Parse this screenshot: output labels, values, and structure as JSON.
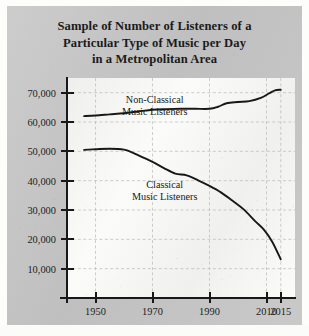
{
  "card": {
    "title_lines": [
      "Sample of Number of Listeners of a",
      "Particular Type of Music per Day",
      "in a Metropolitan Area"
    ]
  },
  "chart_data": {
    "type": "line",
    "title": "Sample of Number of Listeners of a Particular Type of Music per Day in a Metropolitan Area",
    "xlabel": "",
    "ylabel": "",
    "grid": true,
    "legend_position": "inline-annotations",
    "xlim": [
      1940,
      2020
    ],
    "ylim": [
      0,
      75000
    ],
    "xticks": [
      1950,
      1970,
      1990,
      2010,
      2015
    ],
    "yticks": [
      10000,
      20000,
      30000,
      40000,
      50000,
      60000,
      70000
    ],
    "ytick_labels": [
      "10,000",
      "20,000",
      "30,000",
      "40,000",
      "50,000",
      "60,000",
      "70,000"
    ],
    "xtick_labels": [
      "1950",
      "1970",
      "1990",
      "2010",
      "2015"
    ],
    "annotations": [
      {
        "text_lines": [
          "Non-Classical",
          "Music Listeners"
        ],
        "series": "Non-Classical Music Listeners"
      },
      {
        "text_lines": [
          "Classical",
          "Music Listeners"
        ],
        "series": "Classical Music Listeners"
      }
    ],
    "series": [
      {
        "name": "Non-Classical Music Listeners",
        "color": "#16181a",
        "x": [
          1946,
          1950,
          1955,
          1960,
          1965,
          1970,
          1975,
          1980,
          1985,
          1990,
          1993,
          1996,
          2000,
          2004,
          2008,
          2011,
          2013,
          2015
        ],
        "values": [
          62000,
          62200,
          62600,
          63000,
          63600,
          64200,
          64400,
          64500,
          64500,
          64500,
          65200,
          66400,
          66800,
          67100,
          68200,
          69800,
          70800,
          71000
        ]
      },
      {
        "name": "Classical Music Listeners",
        "color": "#16181a",
        "x": [
          1946,
          1950,
          1955,
          1960,
          1963,
          1966,
          1970,
          1974,
          1978,
          1982,
          1986,
          1990,
          1994,
          1998,
          2002,
          2006,
          2009,
          2012,
          2015
        ],
        "values": [
          50500,
          50700,
          50900,
          50600,
          49600,
          48200,
          46400,
          44300,
          42400,
          41800,
          40100,
          38200,
          36000,
          33200,
          30200,
          26200,
          23400,
          19200,
          13200
        ]
      }
    ]
  }
}
